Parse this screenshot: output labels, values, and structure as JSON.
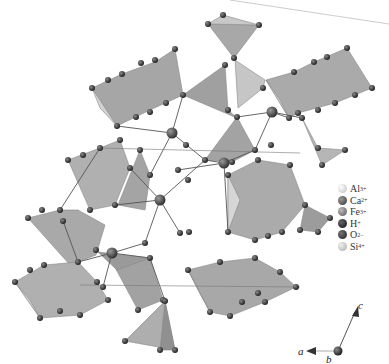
{
  "figure": {
    "legend": [
      {
        "ion": "Al",
        "charge": "3+",
        "color": "#d8d8d8"
      },
      {
        "ion": "Ca",
        "charge": "2+",
        "color": "#505050"
      },
      {
        "ion": "Fe",
        "charge": "3+",
        "color": "#7a7a7a"
      },
      {
        "ion": "H",
        "charge": "+",
        "color": "#2e2e2e"
      },
      {
        "ion": "O",
        "charge": "2−",
        "color": "#3a3a3a"
      },
      {
        "ion": "Si",
        "charge": "4+",
        "color": "#c4c4c4"
      }
    ],
    "axes": {
      "a": "a",
      "b": "b",
      "c": "c"
    },
    "colors": {
      "polyhedron_light": "#dcdcdc",
      "polyhedron_mid": "#b4b4b4",
      "polyhedron_dark": "#8e8e8e",
      "bond": "#555555",
      "oxygen": "#3a3a3a",
      "calcium": "#505050"
    }
  }
}
